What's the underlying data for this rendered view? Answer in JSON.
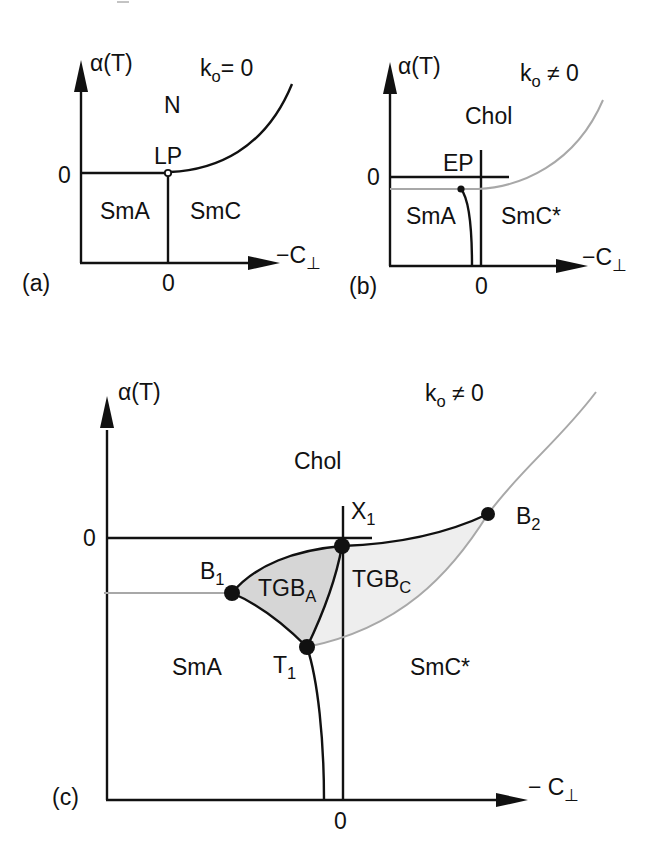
{
  "figure": {
    "panels": [
      {
        "id": "a",
        "tag": "(a)",
        "y_axis_label": "α(T)",
        "x_axis_label": "−C",
        "x_axis_sub": "⊥",
        "condition": "k",
        "condition_sub": "o",
        "condition_rel": "= 0",
        "y_zero": "0",
        "x_zero": "0",
        "phases": [
          "N",
          "SmA",
          "SmC"
        ],
        "points": [
          {
            "label": "LP",
            "style": "open-circle"
          }
        ]
      },
      {
        "id": "b",
        "tag": "(b)",
        "y_axis_label": "α(T)",
        "x_axis_label": "−C",
        "x_axis_sub": "⊥",
        "condition": "k",
        "condition_sub": "o",
        "condition_rel": "≠ 0",
        "y_zero": "0",
        "x_zero": "0",
        "phases": [
          "Chol",
          "SmA",
          "SmC*"
        ],
        "points": [
          {
            "label": "EP",
            "style": "filled-dot"
          }
        ]
      },
      {
        "id": "c",
        "tag": "(c)",
        "y_axis_label": "α(T)",
        "x_axis_label": "− C",
        "x_axis_sub": "⊥",
        "condition": "k",
        "condition_sub": "o",
        "condition_rel": "≠ 0",
        "y_zero": "0",
        "x_zero": "0",
        "phases": [
          "Chol",
          "SmA",
          "SmC*"
        ],
        "regions": [
          {
            "label": "TGB",
            "sub": "A",
            "fill": "#d6d6d6"
          },
          {
            "label": "TGB",
            "sub": "C",
            "fill": "#eeeeee"
          }
        ],
        "points": [
          {
            "label": "B",
            "sub": "1"
          },
          {
            "label": "B",
            "sub": "2"
          },
          {
            "label": "X",
            "sub": "1"
          },
          {
            "label": "T",
            "sub": "1"
          }
        ]
      }
    ],
    "colors": {
      "line": "#111111",
      "gray_line": "#a8a8a8",
      "tgb_a_fill": "#d6d6d6",
      "tgb_c_fill": "#eeeeee"
    }
  }
}
